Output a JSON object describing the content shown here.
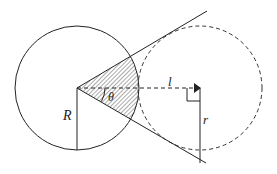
{
  "diagram": {
    "type": "geometry",
    "labels": {
      "R": "R",
      "theta": "θ",
      "l": "l",
      "r": "r"
    },
    "colors": {
      "stroke": "#222222",
      "hatch": "#555555",
      "background": "#ffffff"
    },
    "elements": [
      {
        "id": "big-circle",
        "kind": "circle",
        "style": "solid",
        "center": [
          77,
          88
        ],
        "radius": 62
      },
      {
        "id": "small-circle",
        "kind": "circle",
        "style": "dashed",
        "center": [
          200,
          88
        ],
        "radius": 62
      },
      {
        "id": "tangent-upper",
        "kind": "line",
        "from": [
          77,
          88
        ],
        "to": [
          207,
          11
        ]
      },
      {
        "id": "tangent-lower",
        "kind": "line",
        "from": [
          77,
          88
        ],
        "to": [
          206,
          163
        ]
      },
      {
        "id": "center-line",
        "kind": "line",
        "style": "dashed",
        "from": [
          77,
          88
        ],
        "to": [
          200,
          88
        ]
      },
      {
        "id": "radius-R",
        "kind": "line",
        "from": [
          77,
          88
        ],
        "to": [
          77,
          150
        ]
      },
      {
        "id": "radius-r",
        "kind": "line",
        "from": [
          200,
          88
        ],
        "to": [
          200,
          163
        ]
      },
      {
        "id": "hatched-sector",
        "kind": "sector",
        "center": [
          77,
          88
        ],
        "radius": 62
      }
    ]
  }
}
